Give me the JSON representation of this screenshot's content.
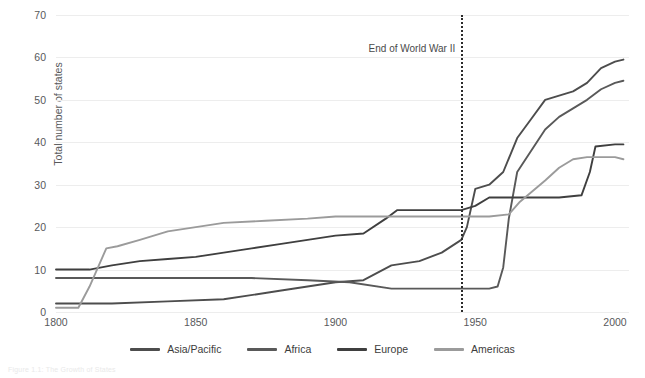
{
  "figure": {
    "caption": "Figure 1.1: The Growth of States",
    "annotation": {
      "label": "End of World War II",
      "year": 1945
    }
  },
  "chart_data": {
    "type": "line",
    "title": "",
    "xlabel": "",
    "ylabel": "Total number of states",
    "xlim": [
      1800,
      2005
    ],
    "ylim": [
      0,
      70
    ],
    "xticks": [
      1800,
      1850,
      1900,
      1950,
      2000
    ],
    "yticks": [
      0,
      10,
      20,
      30,
      40,
      50,
      60,
      70
    ],
    "grid": "horizontal",
    "legend_position": "bottom",
    "annotations": [
      {
        "text": "End of World War II",
        "x": 1945,
        "style": "dotted-vline"
      }
    ],
    "series": [
      {
        "name": "Asia/Pacific",
        "color": "#4d4d4d",
        "points": [
          [
            1800,
            2
          ],
          [
            1810,
            2
          ],
          [
            1820,
            2
          ],
          [
            1840,
            2.5
          ],
          [
            1860,
            3
          ],
          [
            1880,
            5
          ],
          [
            1900,
            7
          ],
          [
            1910,
            7.5
          ],
          [
            1920,
            11
          ],
          [
            1930,
            12
          ],
          [
            1938,
            14
          ],
          [
            1945,
            17
          ],
          [
            1947,
            20
          ],
          [
            1950,
            29
          ],
          [
            1955,
            30
          ],
          [
            1960,
            33
          ],
          [
            1965,
            41
          ],
          [
            1970,
            45.5
          ],
          [
            1975,
            50
          ],
          [
            1980,
            51
          ],
          [
            1985,
            52
          ],
          [
            1990,
            54
          ],
          [
            1995,
            57.5
          ],
          [
            2000,
            59
          ],
          [
            2003,
            59.5
          ]
        ]
      },
      {
        "name": "Africa",
        "color": "#595959",
        "points": [
          [
            1800,
            8
          ],
          [
            1815,
            8
          ],
          [
            1830,
            8
          ],
          [
            1850,
            8
          ],
          [
            1870,
            8
          ],
          [
            1890,
            7.5
          ],
          [
            1905,
            7
          ],
          [
            1920,
            5.5
          ],
          [
            1935,
            5.5
          ],
          [
            1945,
            5.5
          ],
          [
            1950,
            5.5
          ],
          [
            1955,
            5.5
          ],
          [
            1958,
            6
          ],
          [
            1960,
            10.5
          ],
          [
            1962,
            22
          ],
          [
            1965,
            33
          ],
          [
            1970,
            38
          ],
          [
            1975,
            43
          ],
          [
            1980,
            46
          ],
          [
            1985,
            48
          ],
          [
            1990,
            50
          ],
          [
            1995,
            52.5
          ],
          [
            2000,
            54
          ],
          [
            2003,
            54.5
          ]
        ]
      },
      {
        "name": "Europe",
        "color": "#3f3f3f",
        "points": [
          [
            1800,
            10
          ],
          [
            1812,
            10
          ],
          [
            1820,
            11
          ],
          [
            1830,
            12
          ],
          [
            1840,
            12.5
          ],
          [
            1850,
            13
          ],
          [
            1860,
            14
          ],
          [
            1870,
            15
          ],
          [
            1880,
            16
          ],
          [
            1890,
            17
          ],
          [
            1900,
            18
          ],
          [
            1910,
            18.5
          ],
          [
            1918,
            22
          ],
          [
            1922,
            24
          ],
          [
            1930,
            24
          ],
          [
            1938,
            24
          ],
          [
            1945,
            24
          ],
          [
            1950,
            25
          ],
          [
            1955,
            27
          ],
          [
            1960,
            27
          ],
          [
            1970,
            27
          ],
          [
            1980,
            27
          ],
          [
            1988,
            27.5
          ],
          [
            1991,
            33
          ],
          [
            1993,
            39
          ],
          [
            2000,
            39.5
          ],
          [
            2003,
            39.5
          ]
        ]
      },
      {
        "name": "Americas",
        "color": "#9b9b9b",
        "points": [
          [
            1800,
            1
          ],
          [
            1808,
            1
          ],
          [
            1812,
            6
          ],
          [
            1818,
            15
          ],
          [
            1822,
            15.5
          ],
          [
            1830,
            17
          ],
          [
            1840,
            19
          ],
          [
            1850,
            20
          ],
          [
            1860,
            21
          ],
          [
            1875,
            21.5
          ],
          [
            1890,
            22
          ],
          [
            1900,
            22.5
          ],
          [
            1910,
            22.5
          ],
          [
            1920,
            22.5
          ],
          [
            1930,
            22.5
          ],
          [
            1945,
            22.5
          ],
          [
            1955,
            22.5
          ],
          [
            1962,
            23
          ],
          [
            1966,
            26
          ],
          [
            1975,
            31
          ],
          [
            1980,
            34
          ],
          [
            1985,
            36
          ],
          [
            1990,
            36.5
          ],
          [
            2000,
            36.5
          ],
          [
            2003,
            36
          ]
        ]
      }
    ]
  },
  "legend": [
    {
      "label": "Asia/Pacific",
      "color": "#4d4d4d"
    },
    {
      "label": "Africa",
      "color": "#595959"
    },
    {
      "label": "Europe",
      "color": "#3f3f3f"
    },
    {
      "label": "Americas",
      "color": "#9b9b9b"
    }
  ]
}
